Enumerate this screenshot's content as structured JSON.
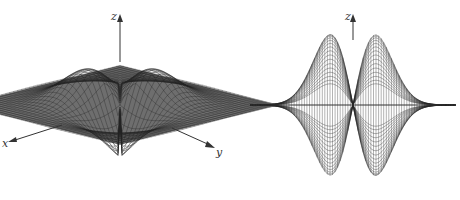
{
  "figure": {
    "panels": [
      {
        "id": "left",
        "description": "3D mesh surface, oblique view",
        "axes": {
          "x": "x",
          "y": "y",
          "z": "z"
        }
      },
      {
        "id": "right",
        "description": "3D mesh surface, side view",
        "axes": {
          "z": "z"
        }
      }
    ],
    "colors": {
      "surface": "#6e6e6e",
      "mesh": "#222222",
      "axis": "#333333"
    }
  }
}
